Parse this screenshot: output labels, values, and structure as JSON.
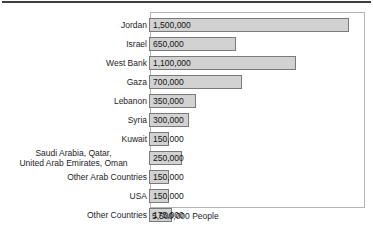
{
  "chart_data": {
    "type": "bar",
    "orientation": "horizontal",
    "title": "",
    "xlabel": "",
    "ylabel": "",
    "caption": "5,500,000 People",
    "grid": false,
    "legend": "none",
    "xlim": [
      0,
      1500000
    ],
    "categories": [
      "Jordan",
      "Israel",
      "West Bank",
      "Gaza",
      "Lebanon",
      "Syria",
      "Kuwait",
      "Saudi Arabia, Qatar,\nUnited Arab Emirates, Oman",
      "Other Arab Countries",
      "USA",
      "Other Countries"
    ],
    "values": [
      1500000,
      650000,
      1100000,
      700000,
      350000,
      300000,
      150000,
      250000,
      150000,
      150000,
      175000
    ],
    "value_labels": [
      "1,500,000",
      "650,000",
      "1,100,000",
      "700,000",
      "350,000",
      "300,000",
      "150,000",
      "250,000",
      "150,000",
      "150,000",
      "175,000"
    ]
  },
  "rows": [
    {
      "label": "Jordan",
      "value_label": "1,500,000",
      "value": 1500000,
      "two_line": false
    },
    {
      "label": "Israel",
      "value_label": "650,000",
      "value": 650000,
      "two_line": false
    },
    {
      "label": "West Bank",
      "value_label": "1,100,000",
      "value": 1100000,
      "two_line": false
    },
    {
      "label": "Gaza",
      "value_label": "700,000",
      "value": 700000,
      "two_line": false
    },
    {
      "label": "Lebanon",
      "value_label": "350,000",
      "value": 350000,
      "two_line": false
    },
    {
      "label": "Syria",
      "value_label": "300,000",
      "value": 300000,
      "two_line": false
    },
    {
      "label": "Kuwait",
      "value_label": "150,000",
      "value": 150000,
      "two_line": false
    },
    {
      "label": "Saudi Arabia, Qatar,\nUnited Arab Emirates, Oman",
      "value_label": "250,000",
      "value": 250000,
      "two_line": true
    },
    {
      "label": "Other Arab Countries",
      "value_label": "150,000",
      "value": 150000,
      "two_line": false
    },
    {
      "label": "USA",
      "value_label": "150,000",
      "value": 150000,
      "two_line": false
    },
    {
      "label": "Other Countries",
      "value_label": "175,000",
      "value": 175000,
      "two_line": false
    }
  ],
  "caption": "5,500,000 People",
  "colors": {
    "bar_fill": "#d2d2d2",
    "bar_border": "#7a7a7a",
    "frame_border": "#b4b4b4",
    "top_rule": "#3d3d42",
    "text": "#1d1d1f",
    "background": "#ffffff"
  },
  "scale": {
    "max_value": 1500000,
    "bar_track_px": 200
  }
}
